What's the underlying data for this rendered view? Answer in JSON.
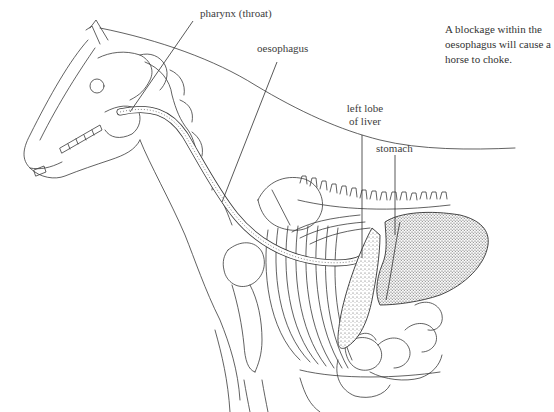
{
  "figure": {
    "labels": {
      "pharynx": "pharynx (throat)",
      "oesophagus": "oesophagus",
      "liver_line1": "left lobe",
      "liver_line2": "of liver",
      "stomach": "stomach"
    },
    "caption": {
      "line1": "A blockage within the",
      "line2": "oesophagus will cause a",
      "line3": "horse to choke."
    }
  },
  "colors": {
    "line": "#3a3a3a",
    "stipple": "#555555",
    "background": "#ffffff"
  }
}
